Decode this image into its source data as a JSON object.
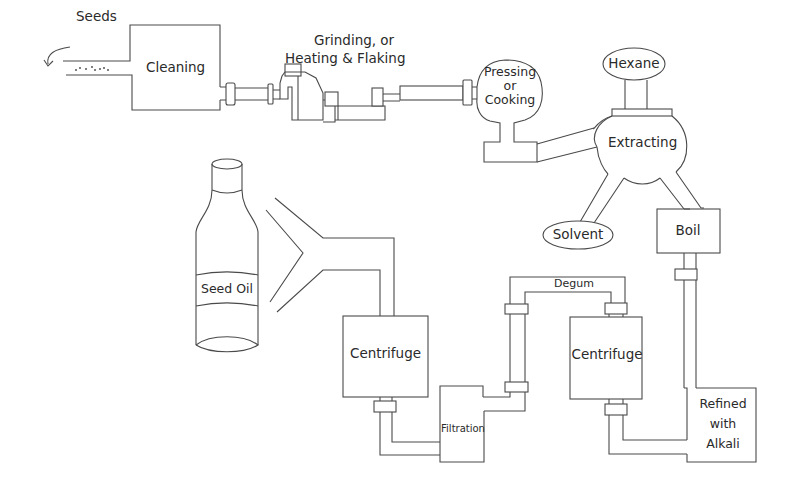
{
  "diagram": {
    "nodes": {
      "seeds": {
        "label": "Seeds"
      },
      "cleaning": {
        "label": "Cleaning"
      },
      "grinding": {
        "line1": "Grinding, or",
        "line2": "Heating & Flaking"
      },
      "pressing": {
        "line1": "Pressing",
        "line2": "or",
        "line3": "Cooking"
      },
      "hexane": {
        "label": "Hexane"
      },
      "extracting": {
        "label": "Extracting"
      },
      "solvent": {
        "label": "Solvent"
      },
      "boil": {
        "label": "Boil"
      },
      "refined": {
        "line1": "Refined",
        "line2": "with",
        "line3": "Alkali"
      },
      "centrifuge_right": {
        "label": "Centrifuge"
      },
      "degum": {
        "label": "Degum"
      },
      "filtration": {
        "label": "Filtration"
      },
      "centrifuge_left": {
        "label": "Centrifuge"
      },
      "seed_oil": {
        "label": "Seed Oil"
      }
    },
    "flow": [
      "Seeds",
      "Cleaning",
      "Grinding, or Heating & Flaking",
      "Pressing or Cooking",
      "Extracting",
      "Boil",
      "Refined with Alkali",
      "Centrifuge",
      "Degum",
      "Filtration",
      "Centrifuge",
      "Seed Oil"
    ],
    "side_inputs": [
      {
        "from": "Hexane",
        "to": "Extracting"
      }
    ],
    "side_outputs": [
      {
        "from": "Extracting",
        "to": "Solvent"
      }
    ],
    "colors": {
      "line": "#4a4a4a",
      "text": "#2a2a2a",
      "background": "#ffffff"
    }
  }
}
